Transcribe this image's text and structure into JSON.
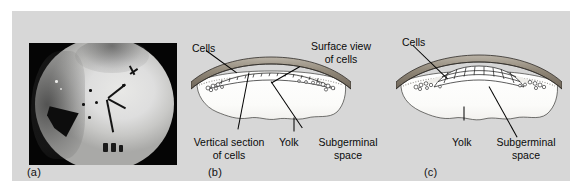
{
  "figure": {
    "background_color": "#ffffff",
    "panel_background_color": "#d7d7d7"
  },
  "panels": [
    {
      "id": "a",
      "letter": "(a)",
      "type": "photomicrograph",
      "description": "Grayscale micrograph of a blastodisc on a dark background",
      "labels": []
    },
    {
      "id": "b",
      "letter": "(b)",
      "type": "line-diagram",
      "description": "Cross section of blastoderm showing a thin single layer of cells over the subgerminal space",
      "labels": [
        {
          "name": "cells",
          "text": "Cells"
        },
        {
          "name": "surface-view-of-cells",
          "text": "Surface view\nof cells",
          "line1": "Surface view",
          "line2": "of cells"
        },
        {
          "name": "vertical-section-of-cells",
          "text": "Vertical section\nof cells",
          "line1": "Vertical section",
          "line2": "of cells"
        },
        {
          "name": "yolk",
          "text": "Yolk"
        },
        {
          "name": "subgerminal-space",
          "text": "Subgerminal\nspace",
          "line1": "Subgerminal",
          "line2": "space"
        }
      ]
    },
    {
      "id": "c",
      "letter": "(c)",
      "type": "line-diagram",
      "description": "Cross section of blastoderm showing a thickened multilayered mound of cells over the subgerminal space",
      "labels": [
        {
          "name": "cells",
          "text": "Cells"
        },
        {
          "name": "yolk",
          "text": "Yolk"
        },
        {
          "name": "subgerminal-space",
          "text": "Subgerminal\nspace",
          "line1": "Subgerminal",
          "line2": "space"
        }
      ]
    }
  ],
  "colors": {
    "membrane_dark": "#6b6258",
    "membrane_mid": "#8d8478",
    "membrane_light": "#b3aca0",
    "yolk": "#fbfbfa",
    "cell_fill": "#ffffff",
    "outline": "#1a1a1a",
    "photo_background": "#050505",
    "disc_light": "#e4e4e2"
  }
}
